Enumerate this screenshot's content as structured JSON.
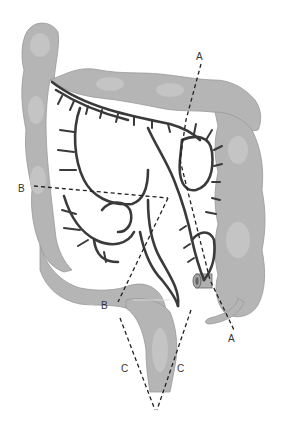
{
  "figure": {
    "colors": {
      "background": "#ffffff",
      "colon_fill": "#b5b5b5",
      "colon_highlight": "#c4c4c4",
      "vessel": "#3a3a3a",
      "dashed_line": "#222222",
      "label_text": "#333333"
    },
    "labels": {
      "A_top": "A",
      "A_bottom": "A",
      "B_left": "B",
      "B_lower": "B",
      "C_left": "C",
      "C_right": "C"
    },
    "lines": [
      {
        "name": "A",
        "description": "dashed line from top right crossing transverse/descending colon down to lower right"
      },
      {
        "name": "B",
        "description": "dashed line from left horizontally to center then down-left toward rectosigmoid"
      },
      {
        "name": "C",
        "description": "two converging dashed lines forming a V below the rectum"
      }
    ]
  }
}
